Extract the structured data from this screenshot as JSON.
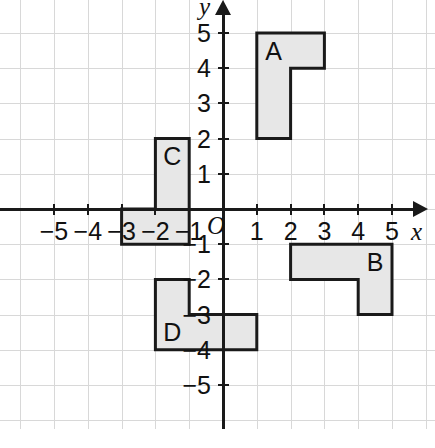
{
  "figure": {
    "type": "coordinate-plane-shapes",
    "title": "",
    "background_color": "#ffffff",
    "grid_color": "#d8d8d8",
    "axis_color": "#1a1a1a",
    "shape_fill_color": "#e7e7e7",
    "shape_stroke_color": "#1a1a1a"
  },
  "axes": {
    "x_axis_name": "x",
    "y_axis_name": "y",
    "origin_label": "O",
    "x_ticks": [
      {
        "value": -5,
        "label": "−5"
      },
      {
        "value": -4,
        "label": "−4"
      },
      {
        "value": -3,
        "label": "−3"
      },
      {
        "value": -2,
        "label": "−2"
      },
      {
        "value": -1,
        "label": "−1"
      },
      {
        "value": 1,
        "label": "1"
      },
      {
        "value": 2,
        "label": "2"
      },
      {
        "value": 3,
        "label": "3"
      },
      {
        "value": 4,
        "label": "4"
      },
      {
        "value": 5,
        "label": "5"
      }
    ],
    "y_ticks": [
      {
        "value": 5,
        "label": "5"
      },
      {
        "value": 4,
        "label": "4"
      },
      {
        "value": 3,
        "label": "3"
      },
      {
        "value": 2,
        "label": "2"
      },
      {
        "value": 1,
        "label": "1"
      },
      {
        "value": -1,
        "label": "−1"
      },
      {
        "value": -2,
        "label": "−2"
      },
      {
        "value": -3,
        "label": "−3"
      },
      {
        "value": -4,
        "label": "−4"
      },
      {
        "value": -5,
        "label": "−5"
      }
    ],
    "xlim": [
      -6.6,
      6.3
    ],
    "ylim": [
      -6.2,
      6.3
    ],
    "grid": true
  },
  "chart_data": {
    "type": "scatter",
    "title": "",
    "xlabel": "x",
    "ylabel": "y",
    "xlim": [
      -6.6,
      6.3
    ],
    "ylim": [
      -6.2,
      6.3
    ],
    "grid": true,
    "legend": "none",
    "shapes": [
      {
        "label": "A",
        "description": "L-shaped hexomino, tall vertical bar with foot extending right at top",
        "label_point": [
          1.5,
          4.5
        ],
        "vertices": [
          [
            1,
            2
          ],
          [
            1,
            5
          ],
          [
            3,
            5
          ],
          [
            3,
            4
          ],
          [
            2,
            4
          ],
          [
            2,
            2
          ]
        ]
      },
      {
        "label": "B",
        "description": "L-shaped hexomino, horizontal bar with leg extending down at right",
        "label_point": [
          4.5,
          -1.5
        ],
        "vertices": [
          [
            2,
            -1
          ],
          [
            5,
            -1
          ],
          [
            5,
            -3
          ],
          [
            4,
            -3
          ],
          [
            4,
            -2
          ],
          [
            2,
            -2
          ]
        ]
      },
      {
        "label": "C",
        "description": "L-shaped hexomino, vertical bar with foot extending left at bottom",
        "label_point": [
          -1.5,
          1.5
        ],
        "vertices": [
          [
            -2,
            2
          ],
          [
            -1,
            2
          ],
          [
            -1,
            -1
          ],
          [
            -3,
            -1
          ],
          [
            -3,
            0
          ],
          [
            -2,
            0
          ]
        ]
      },
      {
        "label": "D",
        "description": "L-shaped hexomino, vertical bar with foot extending right at bottom",
        "label_point": [
          -1.5,
          -3.5
        ],
        "vertices": [
          [
            -2,
            -2
          ],
          [
            -1,
            -2
          ],
          [
            -1,
            -3
          ],
          [
            1,
            -3
          ],
          [
            1,
            -4
          ],
          [
            -2,
            -4
          ]
        ]
      }
    ]
  }
}
